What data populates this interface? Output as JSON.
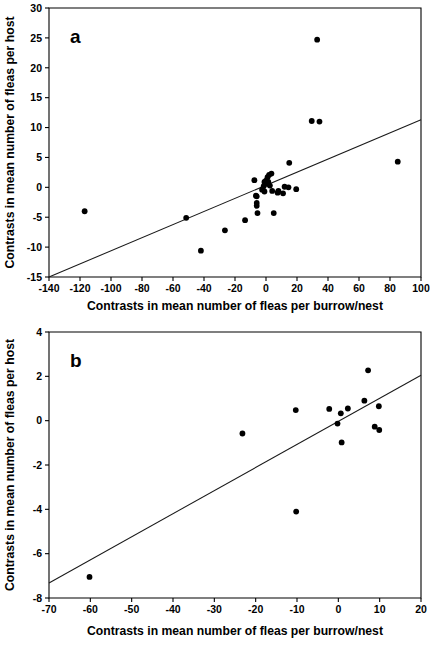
{
  "figure": {
    "title": "",
    "panels": [
      "a",
      "b"
    ]
  },
  "chart_data": [
    {
      "id": "a",
      "type": "scatter",
      "panel_label": "a",
      "title": "",
      "xlabel": "Contrasts in mean number of fleas per burrow/nest",
      "ylabel": "Contrasts in mean number of fleas per host",
      "xlim": [
        -140,
        100
      ],
      "ylim": [
        -15,
        30
      ],
      "xticks": [
        -140,
        -120,
        -100,
        -80,
        -60,
        -40,
        -20,
        0,
        20,
        40,
        60,
        80,
        100
      ],
      "xticklabels": [
        "-140",
        "-120",
        "-100",
        "-80",
        "-60",
        "-40",
        "-20",
        "0",
        "20",
        "40",
        "60",
        "80",
        "100"
      ],
      "yticks": [
        -15,
        -10,
        -5,
        0,
        5,
        10,
        15,
        20,
        25,
        30
      ],
      "yticklabels": [
        "-15",
        "-10",
        "-5",
        "0",
        "5",
        "10",
        "15",
        "20",
        "25",
        "30"
      ],
      "grid": false,
      "legend": "none",
      "points": [
        [
          -117.0,
          -4.0
        ],
        [
          -51.5,
          -5.1
        ],
        [
          -42.0,
          -10.6
        ],
        [
          -26.5,
          -7.2
        ],
        [
          -13.5,
          -5.5
        ],
        [
          -7.5,
          1.2
        ],
        [
          -6.5,
          -1.4
        ],
        [
          -6.0,
          -1.5
        ],
        [
          -6.0,
          -2.6
        ],
        [
          -6.0,
          -3.1
        ],
        [
          -5.5,
          -4.3
        ],
        [
          -2.5,
          -0.4
        ],
        [
          -1.5,
          0.2
        ],
        [
          -1.0,
          0.9
        ],
        [
          -1.0,
          -0.7
        ],
        [
          0.0,
          1.1
        ],
        [
          0.5,
          0.6
        ],
        [
          1.0,
          1.7
        ],
        [
          1.5,
          0.9
        ],
        [
          2.0,
          2.1
        ],
        [
          2.5,
          0.3
        ],
        [
          3.5,
          2.3
        ],
        [
          4.0,
          -0.6
        ],
        [
          5.0,
          -4.3
        ],
        [
          7.5,
          -0.9
        ],
        [
          8.0,
          -0.6
        ],
        [
          11.0,
          -1.0
        ],
        [
          12.0,
          0.1
        ],
        [
          14.5,
          0.0
        ],
        [
          15.0,
          4.1
        ],
        [
          19.5,
          -0.3
        ],
        [
          29.5,
          11.1
        ],
        [
          33.0,
          24.7
        ],
        [
          34.5,
          11.0
        ],
        [
          85.0,
          4.3
        ]
      ],
      "fit_line": {
        "x1": -140,
        "y1": -15,
        "x2": 100,
        "y2": 11.3
      }
    },
    {
      "id": "b",
      "type": "scatter",
      "panel_label": "b",
      "title": "",
      "xlabel": "Contrasts in mean number of fleas per burrow/nest",
      "ylabel": "Contrasts in mean number of fleas per host",
      "xlim": [
        -70,
        20
      ],
      "ylim": [
        -8,
        4
      ],
      "xticks": [
        -70,
        -60,
        -50,
        -40,
        -30,
        -20,
        -10,
        0,
        10,
        20
      ],
      "xticklabels": [
        "-70",
        "-60",
        "-50",
        "-40",
        "-30",
        "-20",
        "-10",
        "0",
        "10",
        "20"
      ],
      "yticks": [
        -8,
        -6,
        -4,
        -2,
        0,
        2,
        4
      ],
      "yticklabels": [
        "-8",
        "-6",
        "-4",
        "-2",
        "0",
        "2",
        "4"
      ],
      "grid": false,
      "legend": "none",
      "points": [
        [
          -60.2,
          -7.05
        ],
        [
          -23.2,
          -0.58
        ],
        [
          -10.3,
          0.48
        ],
        [
          -10.2,
          -4.1
        ],
        [
          -2.2,
          0.53
        ],
        [
          -0.2,
          -0.13
        ],
        [
          0.6,
          0.33
        ],
        [
          0.8,
          -0.98
        ],
        [
          2.3,
          0.55
        ],
        [
          6.3,
          0.9
        ],
        [
          7.2,
          2.27
        ],
        [
          8.8,
          -0.27
        ],
        [
          9.8,
          0.65
        ],
        [
          9.9,
          -0.42
        ]
      ],
      "fit_line": {
        "x1": -70,
        "y1": -7.32,
        "x2": 20,
        "y2": 2.05
      }
    }
  ]
}
